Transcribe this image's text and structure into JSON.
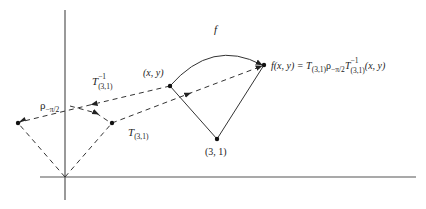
{
  "diagram": {
    "axes": {
      "y_axis": {
        "x": 65,
        "y1": 10,
        "y2": 200
      },
      "x_axis": {
        "y": 177,
        "x1": 40,
        "x2": 416
      }
    },
    "points": {
      "origin": {
        "x": 65,
        "y": 177
      },
      "xy": {
        "x": 170,
        "y": 86,
        "label": "(x, y)"
      },
      "center": {
        "x": 217,
        "y": 139,
        "label": "(3, 1)"
      },
      "image": {
        "x": 264,
        "y": 65
      },
      "translated": {
        "x": 18,
        "y": 123
      },
      "rotated": {
        "x": 112,
        "y": 123
      }
    },
    "labels": {
      "f": "f",
      "xy": "(x, y)",
      "center": "(3, 1)",
      "T_inverse": {
        "base": "T",
        "sup": "−1",
        "sub": "(3,1)"
      },
      "T": {
        "base": "T",
        "sub": "(3,1)"
      },
      "rho": {
        "base": "ρ",
        "sub": "−π/2"
      },
      "formula": {
        "lhs": "f(x, y) = ",
        "T1": "T",
        "T1_sub": "(3,1)",
        "rho": "ρ",
        "rho_sub": "−π/2",
        "T2": "T",
        "T2_sup": "−1",
        "T2_sub": "(3,1)",
        "args": "(x, y)"
      }
    },
    "colors": {
      "line": "#333333",
      "axis": "#555555",
      "text": "#222222"
    }
  }
}
